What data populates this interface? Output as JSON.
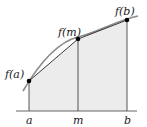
{
  "diagram": {
    "colors": {
      "fill": "#ececec",
      "curve": "#8a8a8a",
      "chord": "#222222",
      "axis": "#555555",
      "ordinate": "#444444",
      "point": "#000000"
    },
    "points": [
      {
        "id": "a",
        "x_label": "a",
        "y_label": "f(a)",
        "px": 29,
        "py": 81
      },
      {
        "id": "m",
        "x_label": "m",
        "y_label": "f(m)",
        "px": 78,
        "py": 39
      },
      {
        "id": "b",
        "x_label": "b",
        "y_label": "f(b)",
        "px": 127,
        "py": 20
      }
    ],
    "axis": {
      "x1": 16,
      "x2": 137,
      "y": 111
    },
    "labels": {
      "fa": "f(a)",
      "fm": "f(m)",
      "fb": "f(b)",
      "a": "a",
      "m": "m",
      "b": "b"
    }
  }
}
